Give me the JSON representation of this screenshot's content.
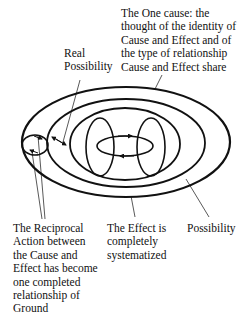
{
  "labels": {
    "one_cause": "The One cause: the\nthought of the identity of\nCause and Effect and of\nthe type of relationship\nCause and Effect share",
    "real_possibility": "Real\nPossibility",
    "reciprocal_action": "The Reciprocal\nAction between\nthe Cause and\nEffect has become\none completed\nrelationship of\nGround",
    "effect_systematized": "The Effect is\ncompletely\nsystematized",
    "possibility": "Possibility"
  },
  "colors": {
    "stroke": "#111111",
    "background": "#ffffff"
  }
}
